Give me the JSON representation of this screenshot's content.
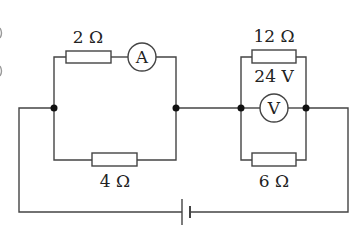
{
  "diagram": {
    "type": "circuit",
    "components": {
      "r_top_left": {
        "label": "2 Ω",
        "value_ohm": 2
      },
      "ammeter": {
        "label": "A"
      },
      "r_bottom_left": {
        "label": "4 Ω",
        "value_ohm": 4
      },
      "r_top_right": {
        "label": "12 Ω",
        "value_ohm": 12
      },
      "voltmeter": {
        "label": "V",
        "reading_label": "24 V"
      },
      "r_bottom_right": {
        "label": "6 Ω",
        "value_ohm": 6
      },
      "battery": {
        "label": ""
      }
    },
    "colors": {
      "wire": "#444444",
      "node": "#111111",
      "background": "#ffffff"
    }
  }
}
